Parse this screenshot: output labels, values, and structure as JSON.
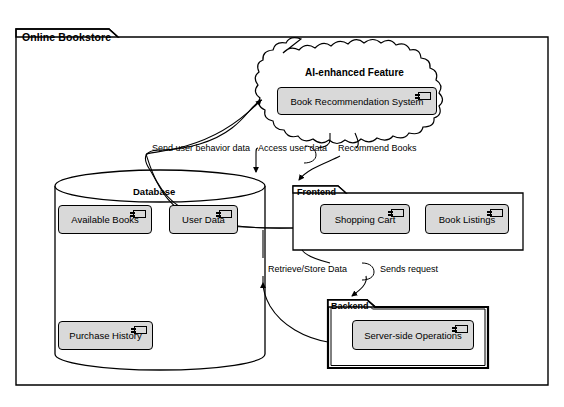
{
  "diagram": {
    "type": "uml-component-diagram",
    "system": {
      "name": "Online Bookstore"
    },
    "cloud": {
      "title": "AI-enhanced Feature",
      "components": [
        {
          "label": "Book Recommendation System",
          "icon": "component-icon"
        }
      ]
    },
    "database": {
      "title": "Database",
      "shape": "cylinder",
      "components": [
        {
          "label": "Available Books",
          "icon": "component-icon"
        },
        {
          "label": "User Data",
          "icon": "component-icon"
        },
        {
          "label": "Purchase History",
          "icon": "component-icon"
        }
      ]
    },
    "packages": [
      {
        "name": "Frontend",
        "components": [
          {
            "label": "Shopping Cart",
            "icon": "component-icon"
          },
          {
            "label": "Book Listings",
            "icon": "component-icon"
          }
        ]
      },
      {
        "name": "Backend",
        "components": [
          {
            "label": "Server-side Operations",
            "icon": "component-icon"
          }
        ]
      }
    ],
    "connections": [
      {
        "label": "Send user behavior data",
        "from": "Frontend",
        "to": "AI-enhanced Feature"
      },
      {
        "label": "Access user data",
        "from": "AI-enhanced Feature",
        "to": "Database"
      },
      {
        "label": "Recommend Books",
        "from": "AI-enhanced Feature",
        "to": "Frontend"
      },
      {
        "label": "Retrieve/Store Data",
        "from": "Backend",
        "to": "Database"
      },
      {
        "label": "Sends request",
        "from": "Frontend",
        "to": "Backend"
      }
    ],
    "colors": {
      "stroke": "#000000",
      "component_fill": "#d9d9d9",
      "background": "#ffffff"
    }
  }
}
